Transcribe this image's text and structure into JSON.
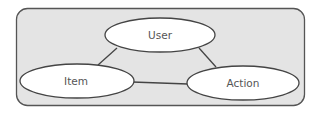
{
  "diagram": {
    "type": "entity-relationship",
    "container": {
      "x": 16,
      "y": 8,
      "width": 288,
      "height": 98,
      "radius": 11,
      "fill": "#e4e4e4",
      "stroke": "#555555"
    },
    "nodes": [
      {
        "id": "user",
        "label": "User",
        "cx": 160,
        "cy": 35,
        "rx": 55,
        "ry": 17
      },
      {
        "id": "item",
        "label": "Item",
        "cx": 77,
        "cy": 81,
        "rx": 57,
        "ry": 17
      },
      {
        "id": "action",
        "label": "Action",
        "cx": 243,
        "cy": 83,
        "rx": 56,
        "ry": 17
      }
    ],
    "edges": [
      {
        "from": "user",
        "to": "item"
      },
      {
        "from": "user",
        "to": "action"
      },
      {
        "from": "item",
        "to": "action"
      }
    ],
    "colors": {
      "node_fill": "#ffffff",
      "node_stroke": "#444444",
      "edge_stroke": "#444444",
      "label_text": "#555555"
    }
  }
}
